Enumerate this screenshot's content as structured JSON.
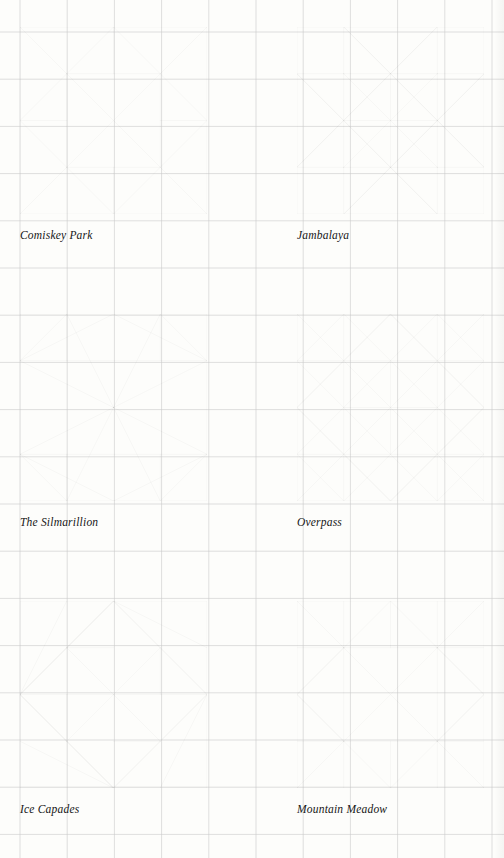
{
  "page": {
    "width": 504,
    "height": 858,
    "background_color": "#fdfdfb",
    "grid": {
      "visible": true,
      "spacing": 47.2,
      "origin_x": 20,
      "origin_y": 32,
      "color": "#c9c9c9",
      "line_width": 0.6
    },
    "ink_color": "#1a1a1a",
    "block_size": 187,
    "columns": 2,
    "rows": 3
  },
  "blocks": [
    {
      "id": "comiskey-park",
      "caption": "Comiskey Park",
      "x": 20,
      "y": 27,
      "size": 187,
      "caption_x": 20,
      "caption_y": 229,
      "units": 4,
      "segments": [
        [
          0,
          0,
          4,
          0
        ],
        [
          4,
          0,
          4,
          4
        ],
        [
          4,
          4,
          0,
          4
        ],
        [
          0,
          4,
          0,
          0
        ],
        [
          2,
          0,
          0,
          2
        ],
        [
          2,
          0,
          4,
          2
        ],
        [
          0,
          2,
          2,
          4
        ],
        [
          4,
          2,
          2,
          4
        ],
        [
          1,
          1,
          3,
          1
        ],
        [
          3,
          1,
          3,
          3
        ],
        [
          3,
          3,
          1,
          3
        ],
        [
          1,
          3,
          1,
          1
        ],
        [
          1,
          1,
          3,
          3
        ],
        [
          3,
          1,
          1,
          3
        ],
        [
          2,
          0,
          2,
          1
        ],
        [
          3,
          2,
          4,
          2
        ],
        [
          2,
          3,
          2,
          4
        ],
        [
          0,
          2,
          1,
          2
        ],
        [
          0,
          0,
          1,
          1
        ],
        [
          4,
          0,
          3,
          1
        ],
        [
          0,
          4,
          1,
          3
        ],
        [
          4,
          4,
          3,
          3
        ]
      ]
    },
    {
      "id": "jambalaya",
      "caption": "Jambalaya",
      "x": 297,
      "y": 27,
      "size": 187,
      "caption_x": 297,
      "caption_y": 229,
      "units": 4,
      "segments": [
        [
          0,
          0,
          4,
          0
        ],
        [
          4,
          0,
          4,
          4
        ],
        [
          4,
          4,
          0,
          4
        ],
        [
          0,
          4,
          0,
          0
        ],
        [
          1,
          0,
          1,
          1
        ],
        [
          3,
          0,
          3,
          1
        ],
        [
          1,
          3,
          1,
          4
        ],
        [
          3,
          3,
          3,
          4
        ],
        [
          0,
          1,
          1,
          1
        ],
        [
          3,
          1,
          4,
          1
        ],
        [
          0,
          3,
          1,
          3
        ],
        [
          3,
          3,
          4,
          3
        ],
        [
          1,
          1,
          3,
          1
        ],
        [
          3,
          1,
          3,
          3
        ],
        [
          3,
          3,
          1,
          3
        ],
        [
          1,
          3,
          1,
          1
        ],
        [
          2,
          1,
          2,
          3
        ],
        [
          1,
          2,
          3,
          2
        ],
        [
          1,
          0,
          2,
          1
        ],
        [
          3,
          0,
          2,
          1
        ],
        [
          1,
          4,
          2,
          3
        ],
        [
          3,
          4,
          2,
          3
        ],
        [
          0,
          1,
          1,
          2
        ],
        [
          0,
          3,
          1,
          2
        ],
        [
          4,
          1,
          3,
          2
        ],
        [
          4,
          3,
          3,
          2
        ],
        [
          1,
          1,
          2,
          2
        ],
        [
          2,
          2,
          3,
          3
        ],
        [
          3,
          1,
          2,
          2
        ],
        [
          2,
          2,
          1,
          3
        ],
        [
          0,
          1,
          2,
          3
        ],
        [
          2,
          1,
          4,
          3
        ],
        [
          2,
          3,
          4,
          1
        ],
        [
          0,
          3,
          2,
          1
        ],
        [
          1,
          0,
          3,
          2
        ],
        [
          3,
          2,
          1,
          4
        ],
        [
          3,
          0,
          1,
          2
        ],
        [
          1,
          2,
          3,
          4
        ]
      ]
    },
    {
      "id": "the-silmarillion",
      "caption": "The Silmarillion",
      "x": 20,
      "y": 314,
      "size": 187,
      "caption_x": 20,
      "caption_y": 516,
      "units": 4,
      "segments": [
        [
          0,
          0,
          4,
          0
        ],
        [
          4,
          0,
          4,
          4
        ],
        [
          4,
          4,
          0,
          4
        ],
        [
          0,
          4,
          0,
          0
        ],
        [
          0,
          1,
          4,
          1
        ],
        [
          0,
          3,
          4,
          3
        ],
        [
          1,
          0,
          0,
          1
        ],
        [
          1,
          0,
          2,
          2
        ],
        [
          3,
          0,
          4,
          1
        ],
        [
          3,
          0,
          2,
          2
        ],
        [
          1,
          4,
          0,
          3
        ],
        [
          1,
          4,
          2,
          2
        ],
        [
          3,
          4,
          4,
          3
        ],
        [
          3,
          4,
          2,
          2
        ],
        [
          0,
          1,
          2,
          2
        ],
        [
          4,
          1,
          2,
          2
        ],
        [
          0,
          3,
          2,
          2
        ],
        [
          4,
          3,
          2,
          2
        ],
        [
          1,
          0,
          1,
          1
        ],
        [
          3,
          0,
          3,
          1
        ],
        [
          1,
          3,
          1,
          4
        ],
        [
          3,
          3,
          3,
          4
        ],
        [
          0,
          1,
          2,
          0
        ],
        [
          4,
          1,
          2,
          0
        ],
        [
          0,
          3,
          2,
          4
        ],
        [
          4,
          3,
          2,
          4
        ]
      ]
    },
    {
      "id": "overpass",
      "caption": "Overpass",
      "x": 297,
      "y": 314,
      "size": 187,
      "caption_x": 297,
      "caption_y": 516,
      "units": 4,
      "segments": [
        [
          0,
          0,
          4,
          0
        ],
        [
          4,
          0,
          4,
          4
        ],
        [
          4,
          4,
          0,
          4
        ],
        [
          0,
          4,
          0,
          0
        ],
        [
          0,
          1,
          4,
          1
        ],
        [
          0,
          3,
          4,
          3
        ],
        [
          1,
          0,
          1,
          4
        ],
        [
          3,
          0,
          3,
          4
        ],
        [
          2,
          1,
          2,
          3
        ],
        [
          1,
          2,
          3,
          2
        ],
        [
          0,
          0,
          4,
          4
        ],
        [
          4,
          0,
          0,
          4
        ],
        [
          1,
          0,
          0,
          1
        ],
        [
          3,
          0,
          4,
          1
        ],
        [
          1,
          4,
          0,
          3
        ],
        [
          3,
          4,
          4,
          3
        ],
        [
          2,
          0,
          0,
          2
        ],
        [
          2,
          0,
          4,
          2
        ],
        [
          2,
          4,
          0,
          2
        ],
        [
          2,
          4,
          4,
          2
        ],
        [
          0,
          1,
          3,
          4
        ],
        [
          1,
          0,
          4,
          3
        ],
        [
          0,
          3,
          3,
          0
        ],
        [
          1,
          4,
          4,
          1
        ],
        [
          0,
          2,
          2,
          0
        ],
        [
          2,
          0,
          4,
          2
        ],
        [
          0,
          2,
          2,
          4
        ],
        [
          2,
          4,
          4,
          2
        ]
      ]
    },
    {
      "id": "ice-capades",
      "caption": "Ice Capades",
      "x": 20,
      "y": 601,
      "size": 187,
      "caption_x": 20,
      "caption_y": 803,
      "units": 4,
      "segments": [
        [
          0,
          0,
          4,
          0
        ],
        [
          4,
          0,
          4,
          4
        ],
        [
          4,
          4,
          0,
          4
        ],
        [
          0,
          4,
          0,
          0
        ],
        [
          2,
          0,
          0,
          2
        ],
        [
          2,
          0,
          4,
          2
        ],
        [
          0,
          2,
          2,
          4
        ],
        [
          4,
          2,
          2,
          4
        ],
        [
          0,
          2,
          4,
          2
        ],
        [
          1,
          1,
          2,
          1
        ],
        [
          3,
          1,
          3,
          2
        ],
        [
          1,
          2,
          1,
          3
        ],
        [
          2,
          3,
          3,
          3
        ],
        [
          1,
          1,
          2,
          2
        ],
        [
          2,
          2,
          3,
          3
        ],
        [
          3,
          1,
          2,
          2
        ],
        [
          2,
          2,
          1,
          3
        ],
        [
          2,
          0,
          1,
          1
        ],
        [
          2,
          0,
          3,
          1
        ],
        [
          2,
          4,
          1,
          3
        ],
        [
          2,
          4,
          3,
          3
        ],
        [
          0,
          2,
          1,
          1
        ],
        [
          4,
          2,
          3,
          1
        ],
        [
          0,
          2,
          1,
          3
        ],
        [
          4,
          2,
          3,
          3
        ],
        [
          1,
          0,
          0,
          2
        ],
        [
          2,
          0,
          4,
          1
        ],
        [
          0,
          3,
          2,
          4
        ],
        [
          3,
          4,
          4,
          2
        ],
        [
          2,
          0,
          0,
          2
        ],
        [
          0,
          2,
          2,
          4
        ]
      ]
    },
    {
      "id": "mountain-meadow",
      "caption": "Mountain Meadow",
      "x": 297,
      "y": 601,
      "size": 187,
      "caption_x": 297,
      "caption_y": 803,
      "units": 4,
      "segments": [
        [
          0,
          0,
          4,
          0
        ],
        [
          4,
          0,
          4,
          4
        ],
        [
          4,
          4,
          0,
          4
        ],
        [
          0,
          4,
          0,
          0
        ],
        [
          1,
          1,
          3,
          1
        ],
        [
          3,
          1,
          3,
          3
        ],
        [
          3,
          3,
          1,
          3
        ],
        [
          1,
          3,
          1,
          1
        ],
        [
          0,
          1,
          1,
          1
        ],
        [
          3,
          1,
          4,
          1
        ],
        [
          0,
          3,
          1,
          3
        ],
        [
          3,
          3,
          4,
          3
        ],
        [
          1,
          0,
          1,
          1
        ],
        [
          3,
          0,
          3,
          1
        ],
        [
          1,
          3,
          1,
          4
        ],
        [
          3,
          3,
          3,
          4
        ],
        [
          2,
          0,
          2,
          1
        ],
        [
          2,
          3,
          2,
          4
        ],
        [
          0,
          0,
          1,
          1
        ],
        [
          4,
          0,
          3,
          1
        ],
        [
          0,
          4,
          1,
          3
        ],
        [
          4,
          4,
          3,
          3
        ],
        [
          1,
          1,
          2,
          0
        ],
        [
          3,
          1,
          2,
          0
        ],
        [
          1,
          3,
          2,
          4
        ],
        [
          3,
          3,
          2,
          4
        ],
        [
          1,
          1,
          0,
          2
        ],
        [
          1,
          3,
          0,
          2
        ],
        [
          3,
          1,
          4,
          2
        ],
        [
          3,
          3,
          4,
          2
        ],
        [
          1,
          1,
          3,
          3
        ],
        [
          3,
          1,
          1,
          3
        ],
        [
          0,
          2,
          1,
          1
        ],
        [
          0,
          2,
          1,
          3
        ],
        [
          4,
          2,
          3,
          1
        ],
        [
          4,
          2,
          3,
          3
        ]
      ]
    }
  ]
}
